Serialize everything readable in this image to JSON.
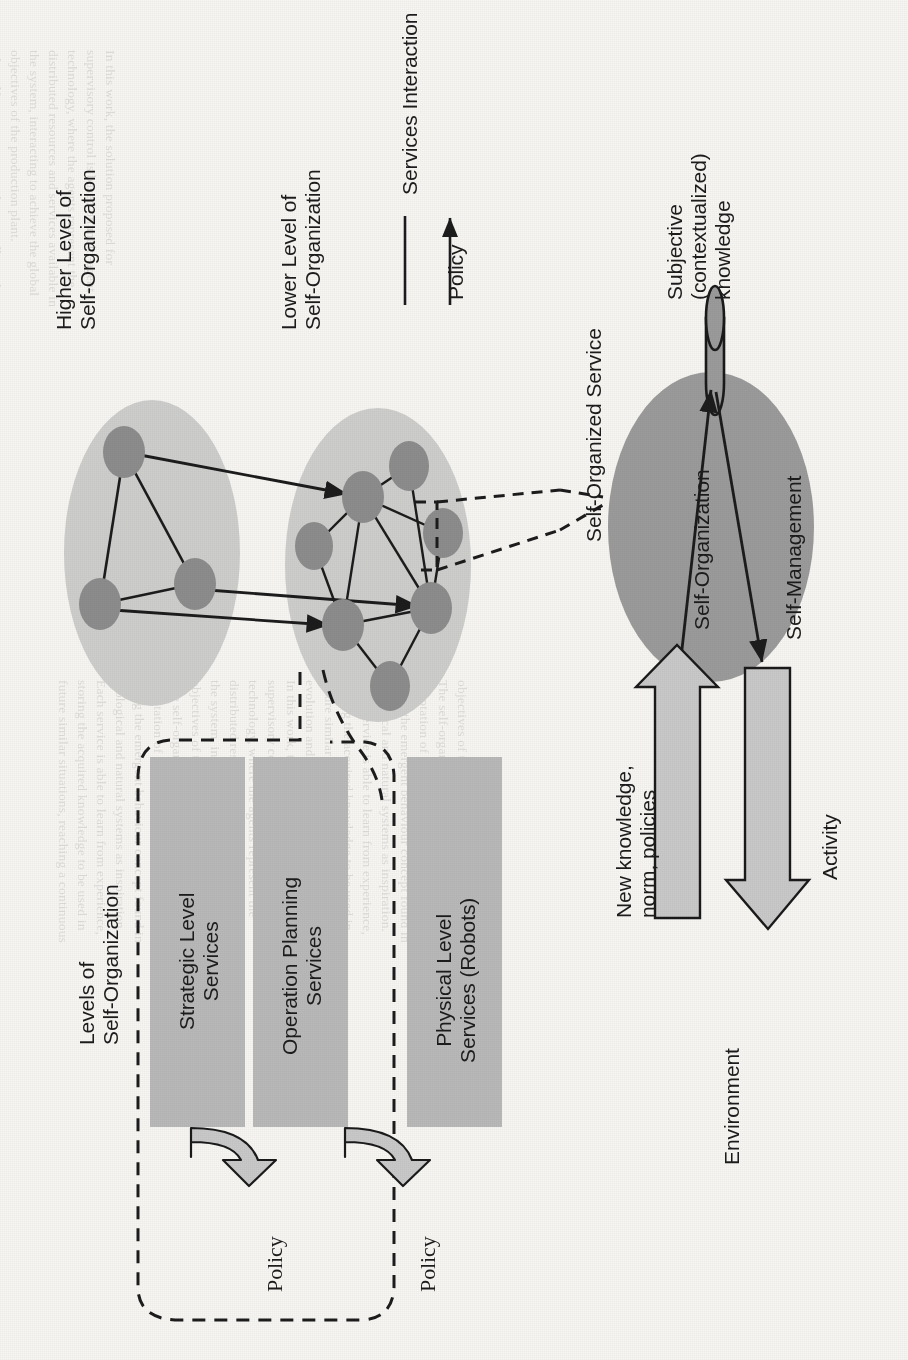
{
  "figure": {
    "title_hidden": "Self-organization architecture diagram (rotated 90 degrees counter-clockwise on the scanned page)",
    "labels": {
      "higher_level": "Higher Level of\nSelf-Organization",
      "lower_level": "Lower Level of\nSelf-Organization",
      "levels_of_self_org": "Levels of\nSelf-Organization",
      "self_organized_service": "Self-Organized Service",
      "subjective_knowledge": "Subjective\n(contextualized)\nknowledge",
      "self_organization": "Self-Organization",
      "self_management": "Self-Management",
      "new_knowledge": "New knowledge,\nnorm, policies",
      "activity": "Activity",
      "environment": "Environment"
    },
    "legend": {
      "items": [
        {
          "symbol": "line",
          "label": "Services Interaction"
        },
        {
          "symbol": "arrow",
          "label": "Policy"
        }
      ]
    },
    "service_levels": [
      {
        "id": "strategic",
        "label": "Strategic Level\nServices"
      },
      {
        "id": "operation-planning",
        "label": "Operation Planning\nServices"
      },
      {
        "id": "physical",
        "label": "Physical Level\nServices (Robots)"
      }
    ],
    "policy_arrows": [
      {
        "id": "policy-1",
        "label": "Policy"
      },
      {
        "id": "policy-2",
        "label": "Policy"
      }
    ],
    "colors": {
      "page_background": "#f7f6f3",
      "cluster_oval": "#cfcfcf",
      "node": "#8b8b8b",
      "service_box": "#b9b9b9",
      "self_organized_oval": "#9a9a9a",
      "block_arrow": "#c8c8c8",
      "stroke": "#1c1c1c"
    },
    "graph": {
      "higher_level_nodes": [
        {
          "id": "h1",
          "cx": 124,
          "cy": 452
        },
        {
          "id": "h2",
          "cx": 100,
          "cy": 604
        },
        {
          "id": "h3",
          "cx": 195,
          "cy": 584
        }
      ],
      "higher_level_edges": [
        [
          "h1",
          "h2"
        ],
        [
          "h1",
          "h3"
        ],
        [
          "h2",
          "h3"
        ]
      ],
      "lower_level_nodes": [
        {
          "id": "l1",
          "cx": 363,
          "cy": 497
        },
        {
          "id": "l2",
          "cx": 409,
          "cy": 466
        },
        {
          "id": "l3",
          "cx": 443,
          "cy": 533
        },
        {
          "id": "l4",
          "cx": 314,
          "cy": 546
        },
        {
          "id": "l5",
          "cx": 431,
          "cy": 608
        },
        {
          "id": "l6",
          "cx": 343,
          "cy": 625
        },
        {
          "id": "l7",
          "cx": 390,
          "cy": 686
        }
      ],
      "lower_level_edges": [
        [
          "l1",
          "l2"
        ],
        [
          "l1",
          "l3"
        ],
        [
          "l1",
          "l4"
        ],
        [
          "l1",
          "l5"
        ],
        [
          "l1",
          "l6"
        ],
        [
          "l2",
          "l5"
        ],
        [
          "l3",
          "l5"
        ],
        [
          "l4",
          "l6"
        ],
        [
          "l5",
          "l6"
        ],
        [
          "l5",
          "l7"
        ],
        [
          "l6",
          "l7"
        ]
      ],
      "policy_edges": [
        {
          "from": "h1",
          "to": "l1"
        },
        {
          "from": "h3",
          "to": "l5"
        },
        {
          "from": "h2",
          "to": "l6"
        }
      ]
    }
  },
  "bleed_text": [
    "In this work, the solution proposed for",
    "supervisory control is based on multi-agent",
    "technology, where the agents represent the",
    "distributed resources and services available in",
    "the system, interacting to achieve the global",
    "objectives of the production plant.",
    "The self-organization mechanism allows the",
    "adaptation of the system to condition changes,",
    "using the emergent behaviour concept found in",
    "biological and natural systems as inspiration.",
    "Each service is able to learn from experience,",
    "storing the acquired knowledge to be used in",
    "future similar situations, reaching a continuous",
    "evolution and improvement of the system."
  ]
}
